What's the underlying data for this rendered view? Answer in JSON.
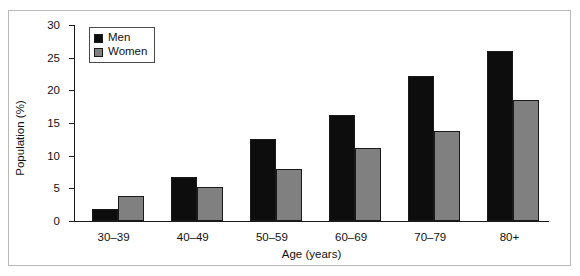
{
  "figure": {
    "background_color": "#ffffff",
    "frame_color": "#b9b9b9"
  },
  "legend": {
    "position": "top-left-inside",
    "entries": [
      {
        "label": "Men",
        "color": "#0d0d0d"
      },
      {
        "label": "Women",
        "color": "#808080"
      }
    ]
  },
  "chart_data": {
    "type": "bar",
    "title": "",
    "subtitle": "",
    "xlabel": "Age (years)",
    "ylabel": "Population (%)",
    "categories": [
      "30–39",
      "40–49",
      "50–59",
      "60–69",
      "70–79",
      "80+"
    ],
    "series": [
      {
        "name": "Men",
        "color": "#0d0d0d",
        "values": [
          1.8,
          6.7,
          12.6,
          16.2,
          22.2,
          26.0
        ]
      },
      {
        "name": "Women",
        "color": "#808080",
        "values": [
          3.8,
          5.2,
          7.9,
          11.1,
          13.8,
          18.5
        ]
      }
    ],
    "ylim": [
      0,
      30
    ],
    "yticks": [
      0,
      5,
      10,
      15,
      20,
      25,
      30
    ],
    "ytick_labels": [
      "0",
      "5",
      "10",
      "15",
      "20",
      "25",
      "30"
    ],
    "grid": false,
    "legend_position": "upper left",
    "annotations": []
  }
}
